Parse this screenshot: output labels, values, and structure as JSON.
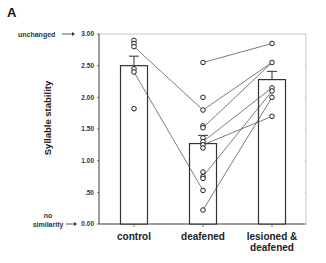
{
  "panel_label": "A",
  "chart_data": {
    "type": "bar",
    "title": "",
    "xlabel": "",
    "ylabel": "Syllable stability",
    "ylim": [
      0,
      3
    ],
    "yticks": [
      0.0,
      0.5,
      1.0,
      1.5,
      2.0,
      2.5,
      3.0
    ],
    "ytick_labels": [
      "0.00",
      ".50",
      "1.00",
      "1.50",
      "2.00",
      "2.50",
      "3.00"
    ],
    "annotations": [
      {
        "text": "unchanged",
        "y": 3.0
      },
      {
        "text": "no similarity",
        "lines": [
          "no",
          "similarity"
        ],
        "y": 0.0
      }
    ],
    "categories": [
      "control",
      "deafened",
      "lesioned & deafened"
    ],
    "category_lines": [
      [
        "control"
      ],
      [
        "deafened"
      ],
      [
        "lesioned &",
        "deafened"
      ]
    ],
    "values": [
      2.5,
      1.27,
      2.28
    ],
    "error_bars": [
      0.15,
      0.13,
      0.13
    ],
    "individual_points": [
      [
        2.9,
        2.85,
        2.8,
        2.45,
        2.4,
        1.82
      ],
      [
        2.55,
        2.0,
        1.8,
        1.55,
        1.52,
        1.36,
        1.3,
        1.25,
        1.2,
        0.82,
        0.75,
        0.72,
        0.53,
        0.22
      ],
      [
        2.85,
        2.55,
        2.15,
        2.1,
        2.0,
        1.7
      ]
    ],
    "connections": [
      {
        "from": [
          0,
          2.8
        ],
        "to": [
          1,
          1.8
        ]
      },
      {
        "from": [
          0,
          2.4
        ],
        "to": [
          1,
          0.53
        ]
      },
      {
        "from": [
          1,
          2.55
        ],
        "to": [
          2,
          2.85
        ]
      },
      {
        "from": [
          1,
          1.8
        ],
        "to": [
          2,
          2.55
        ]
      },
      {
        "from": [
          1,
          1.52
        ],
        "to": [
          2,
          2.55
        ]
      },
      {
        "from": [
          1,
          1.3
        ],
        "to": [
          2,
          2.15
        ]
      },
      {
        "from": [
          1,
          1.25
        ],
        "to": [
          2,
          1.7
        ]
      },
      {
        "from": [
          1,
          0.75
        ],
        "to": [
          2,
          2.1
        ]
      },
      {
        "from": [
          1,
          0.22
        ],
        "to": [
          2,
          2.0
        ]
      }
    ],
    "grid": false,
    "legend": null,
    "colors": {
      "bar_fill": "#ffffff",
      "bar_stroke": "#333333",
      "axis": "#555555",
      "point_stroke": "#222222",
      "line": "#444444"
    }
  }
}
